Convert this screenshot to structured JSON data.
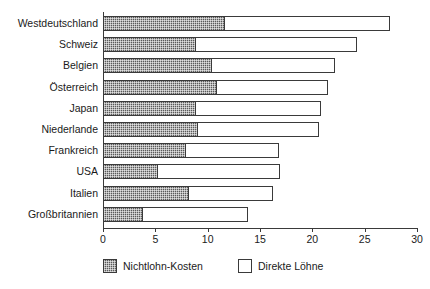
{
  "chart_data": {
    "type": "bar",
    "orientation": "horizontal",
    "stacked": true,
    "title": "",
    "subtitle": "",
    "xlabel": "",
    "ylabel": "",
    "xlim": [
      0,
      30
    ],
    "xticks": [
      0,
      5,
      10,
      15,
      20,
      25,
      30
    ],
    "xtick_labels": [
      "0",
      "5",
      "10",
      "15",
      "20",
      "25",
      "30"
    ],
    "grid": false,
    "legend_position": "bottom",
    "categories": [
      "Westdeutschland",
      "Schweiz",
      "Belgien",
      "Österreich",
      "Japan",
      "Niederlande",
      "Frankreich",
      "USA",
      "Italien",
      "Großbritannien"
    ],
    "series": [
      {
        "name": "Nichtlohn-Kosten",
        "fill": "hatched-dark",
        "values": [
          11.7,
          8.9,
          10.4,
          10.9,
          8.9,
          9.1,
          7.9,
          5.3,
          8.2,
          3.8
        ]
      },
      {
        "name": "Direkte Löhne",
        "fill": "white",
        "values": [
          15.7,
          15.4,
          11.8,
          10.6,
          11.9,
          11.5,
          8.9,
          11.6,
          8.0,
          10.1
        ]
      }
    ],
    "totals": [
      27.4,
      24.3,
      22.2,
      21.5,
      20.8,
      20.6,
      16.8,
      16.9,
      16.2,
      13.9
    ]
  },
  "legend": {
    "items": [
      {
        "label": "Nichtlohn-Kosten",
        "swatch": "hatched"
      },
      {
        "label": "Direkte Löhne",
        "swatch": "plain"
      }
    ]
  },
  "colors": {
    "axis": "#3a3a3a",
    "nonwage_fill": "#5a5a5a",
    "wage_fill": "#ffffff",
    "text": "#1a1a1a",
    "background": "#ffffff"
  }
}
